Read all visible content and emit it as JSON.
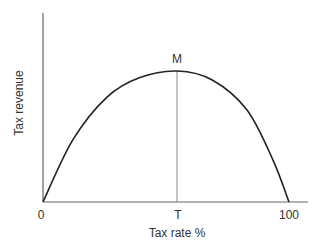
{
  "chart_data": {
    "type": "line",
    "title": "",
    "xlabel": "Tax rate %",
    "ylabel": "Tax revenue",
    "x_ticks": [
      "0",
      "T",
      "100"
    ],
    "x_tick_positions": [
      0,
      54.5,
      100
    ],
    "peak_label": "M",
    "peak": {
      "x": 54.5,
      "y": 100
    },
    "xlim": [
      0,
      107
    ],
    "ylim": [
      0,
      144
    ],
    "grid": false,
    "legend": null,
    "series": [
      {
        "name": "Laffer curve",
        "x": [
          0,
          12,
          26,
          39.4,
          54.5,
          69,
          83,
          93.5,
          100
        ],
        "y": [
          0,
          47,
          80,
          95,
          100,
          93,
          70,
          32,
          0
        ]
      }
    ],
    "annotations": [
      {
        "type": "vertical-line",
        "x": 54.5,
        "from_y": 0,
        "to_y": 100,
        "label_bottom": "T",
        "label_top": "M"
      }
    ]
  },
  "labels": {
    "x_axis": "Tax rate %",
    "y_axis": "Tax revenue",
    "tick_zero": "0",
    "tick_t": "T",
    "tick_hundred": "100",
    "peak": "M"
  }
}
